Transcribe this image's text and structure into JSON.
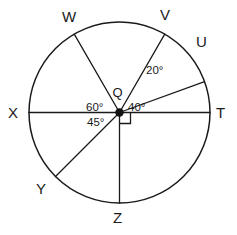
{
  "figure": {
    "background_color": "#ffffff",
    "line_color": "#1a1a1a",
    "center_label": "Q"
  },
  "circle": {
    "cx": 119.5,
    "cy": 112.5,
    "r": 90.5
  },
  "points": [
    {
      "id": "W",
      "label": "W",
      "angle_deg": 120,
      "label_x": 62,
      "label_y": 8
    },
    {
      "id": "V",
      "label": "V",
      "angle_deg": 60,
      "label_x": 160,
      "label_y": 6
    },
    {
      "id": "U",
      "label": "U",
      "angle_deg": 20,
      "label_x": 196,
      "label_y": 33
    },
    {
      "id": "T",
      "label": "T",
      "angle_deg": 0,
      "label_x": 216,
      "label_y": 104
    },
    {
      "id": "X",
      "label": "X",
      "angle_deg": 180,
      "label_x": 8,
      "label_y": 104
    },
    {
      "id": "Y",
      "label": "Y",
      "angle_deg": 225,
      "label_x": 36,
      "label_y": 180
    },
    {
      "id": "Z",
      "label": "Z",
      "angle_deg": 270,
      "label_x": 113,
      "label_y": 209
    }
  ],
  "rays": [
    {
      "from": "Q",
      "to": "W"
    },
    {
      "from": "Q",
      "to": "V"
    },
    {
      "from": "Q",
      "to": "U"
    },
    {
      "from": "Q",
      "to": "T"
    },
    {
      "from": "Q",
      "to": "X"
    },
    {
      "from": "Q",
      "to": "Y"
    },
    {
      "from": "Q",
      "to": "Z"
    }
  ],
  "angle_labels": [
    {
      "id": "angle-60",
      "text": "60°",
      "x": 86,
      "y": 101
    },
    {
      "id": "angle-40",
      "text": "40°",
      "x": 128,
      "y": 101
    },
    {
      "id": "angle-20",
      "text": "20°",
      "x": 146,
      "y": 64
    },
    {
      "id": "angle-45",
      "text": "45°",
      "x": 87,
      "y": 116
    }
  ],
  "right_angle": {
    "id": "right-angle-marker",
    "between": "T and Z",
    "size": 11
  },
  "chart_data": {
    "type": "diagram",
    "shape": "circle",
    "center": "Q",
    "radius_px": 90.5,
    "labeled_points": [
      "W",
      "V",
      "U",
      "T",
      "X",
      "Y",
      "Z"
    ],
    "point_angles_deg": {
      "T": 0,
      "U": 20,
      "V": 60,
      "W": 120,
      "X": 180,
      "Y": 225,
      "Z": 270
    },
    "marked_angles": [
      {
        "label": "20°",
        "value": 20,
        "arms": [
          "U",
          "V"
        ]
      },
      {
        "label": "40°",
        "value": 40,
        "arms": [
          "T",
          "V"
        ]
      },
      {
        "label": "60°",
        "value": 60,
        "arms": [
          "V",
          "W"
        ]
      },
      {
        "label": "45°",
        "value": 45,
        "arms": [
          "X",
          "Y"
        ]
      },
      {
        "label": "90°",
        "value": 90,
        "arms": [
          "T",
          "Z"
        ],
        "notation": "right-angle-square"
      }
    ],
    "diameters": [
      "XT"
    ],
    "legend": null,
    "grid": false
  }
}
